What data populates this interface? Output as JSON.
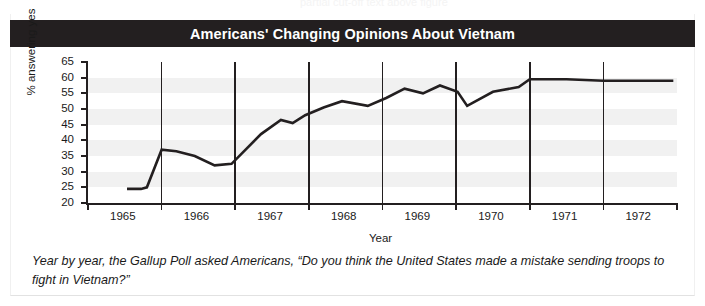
{
  "ghost_line": "partial cut-off text above figure",
  "title": "Americans' Changing Opinions About Vietnam",
  "caption": "Year by year, the Gallup Poll asked Americans, “Do you think the United States made a mistake sending troops to fight in Vietnam?”",
  "colors": {
    "title_bar": "#231f20",
    "title_text": "#ffffff",
    "line": "#231f20",
    "band": "#f1f1f1",
    "axis": "#231f20",
    "page_background": "#ffffff"
  },
  "chart_data": {
    "type": "line",
    "title": "Americans' Changing Opinions About Vietnam",
    "xlabel": "Year",
    "ylabel": "% answering yes",
    "ylim": [
      20,
      65
    ],
    "ytick_values": [
      20,
      25,
      30,
      35,
      40,
      45,
      50,
      55,
      60,
      65
    ],
    "ytick_labels": [
      "20",
      "25",
      "30",
      "35",
      "40",
      "45",
      "50",
      "55",
      "60",
      "65"
    ],
    "xlim": [
      1965,
      1973
    ],
    "xtick_values": [
      1965,
      1966,
      1967,
      1968,
      1969,
      1970,
      1971,
      1972,
      1973
    ],
    "xtick_labels": [
      "1965",
      "1966",
      "1967",
      "1968",
      "1969",
      "1970",
      "1971",
      "1972"
    ],
    "xtick_label_placement": "between-ticks",
    "grid": "vertical gridlines at year boundaries; horizontal alternating shaded bands",
    "legend": "none",
    "series": [
      {
        "name": "% answering yes",
        "x": [
          1965.53,
          1965.72,
          1965.8,
          1966.0,
          1966.2,
          1966.45,
          1966.72,
          1966.95,
          1967.35,
          1967.62,
          1967.78,
          1967.95,
          1968.2,
          1968.45,
          1968.8,
          1969.05,
          1969.3,
          1969.55,
          1969.78,
          1970.02,
          1970.15,
          1970.5,
          1970.85,
          1971.0,
          1971.5,
          1972.0,
          1972.5,
          1972.95
        ],
        "y": [
          24.5,
          24.5,
          25.0,
          37.0,
          36.5,
          35.0,
          32.0,
          32.5,
          42.0,
          46.5,
          45.5,
          48.0,
          50.5,
          52.5,
          51.0,
          53.5,
          56.5,
          55.0,
          57.5,
          55.5,
          51.0,
          55.5,
          57.0,
          59.5,
          59.5,
          59.0,
          59.0,
          59.0
        ]
      }
    ]
  }
}
